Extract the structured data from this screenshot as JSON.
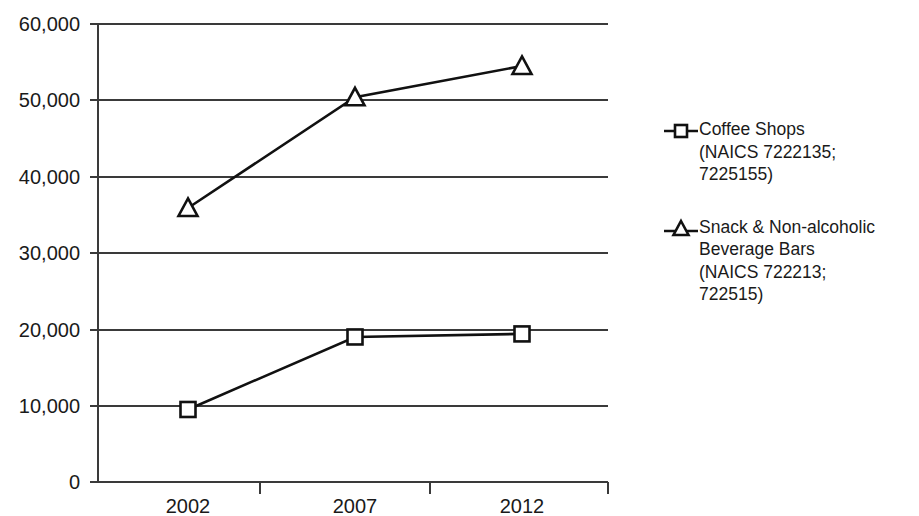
{
  "chart_data": {
    "type": "line",
    "title": "",
    "subtitle": "",
    "xlabel": "",
    "ylabel": "",
    "categories": [
      "2002",
      "2007",
      "2012"
    ],
    "x": [
      2002,
      2007,
      2012
    ],
    "ylim": [
      0,
      60000
    ],
    "ytick_values": [
      0,
      10000,
      20000,
      30000,
      40000,
      50000,
      60000
    ],
    "ytick_labels": [
      "0",
      "10,000",
      "20,000",
      "30,000",
      "40,000",
      "50,000",
      "60,000"
    ],
    "xtick_labels": [
      "2002",
      "2007",
      "2012"
    ],
    "grid": "horizontal",
    "legend_position": "right",
    "series": [
      {
        "name": "Coffee Shops (NAICS 7222135; 7225155)",
        "legend_label": "Coffee Shops\n(NAICS 7222135;\n7225155)",
        "marker": "square",
        "color": "#111111",
        "values": [
          9500,
          19000,
          19400
        ]
      },
      {
        "name": "Snack & Non-alcoholic Beverage Bars (NAICS 722213; 722515)",
        "legend_label": "Snack & Non-alcoholic\nBeverage Bars\n(NAICS 722213;\n722515)",
        "marker": "triangle",
        "color": "#111111",
        "values": [
          35900,
          50400,
          54500
        ]
      }
    ]
  },
  "legend": {
    "entries": [
      {
        "label": "Coffee Shops\n(NAICS 7222135;\n7225155)",
        "marker": "square-marker-icon"
      },
      {
        "label": "Snack & Non-alcoholic\nBeverage Bars\n(NAICS 722213;\n722515)",
        "marker": "triangle-marker-icon"
      }
    ]
  },
  "axes": {
    "y_labels": [
      "60,000",
      "50,000",
      "40,000",
      "30,000",
      "20,000",
      "10,000",
      "0"
    ],
    "x_labels": [
      "2002",
      "2007",
      "2012"
    ]
  }
}
